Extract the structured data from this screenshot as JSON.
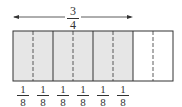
{
  "diagram": {
    "title_fraction": {
      "numerator": "3",
      "denominator": "4"
    },
    "total_parts": 8,
    "shaded_parts": 6,
    "shaded_color": "#e6e6e6",
    "border_color": "#333333",
    "bottom_labels": [
      {
        "numerator": "1",
        "denominator": "8"
      },
      {
        "numerator": "1",
        "denominator": "8"
      },
      {
        "numerator": "1",
        "denominator": "8"
      },
      {
        "numerator": "1",
        "denominator": "8"
      },
      {
        "numerator": "1",
        "denominator": "8"
      },
      {
        "numerator": "1",
        "denominator": "8"
      }
    ]
  }
}
